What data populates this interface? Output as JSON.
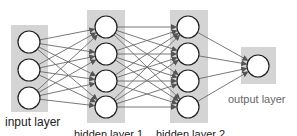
{
  "diagram": {
    "type": "feedforward-neural-network",
    "layers": [
      {
        "id": "input",
        "label": "input layer",
        "nodes": 3,
        "box": {
          "x": 11,
          "y": 25,
          "w": 37,
          "h": 87
        },
        "cx": 29,
        "cy": [
          42,
          70,
          98
        ]
      },
      {
        "id": "hidden1",
        "label": "hidden layer 1",
        "nodes": 4,
        "box": {
          "x": 87,
          "y": 10,
          "w": 38,
          "h": 113
        },
        "cx": 106,
        "cy": [
          27,
          54,
          81,
          107
        ]
      },
      {
        "id": "hidden2",
        "label": "hidden layer 2",
        "nodes": 4,
        "box": {
          "x": 170,
          "y": 10,
          "w": 38,
          "h": 113
        },
        "cx": 188,
        "cy": [
          27,
          54,
          81,
          107
        ]
      },
      {
        "id": "output",
        "label": "output layer",
        "nodes": 1,
        "box": {
          "x": 241,
          "y": 47,
          "w": 35,
          "h": 37
        },
        "cx": 258,
        "cy": [
          66
        ]
      }
    ],
    "node_radius": 11,
    "colors": {
      "layer_box": "#d4d4d4",
      "node_fill": "#ffffff",
      "node_stroke": "#222222",
      "edge": "#6a6a6a"
    },
    "connectivity": "fully-connected"
  },
  "labels": {
    "input": "input layer",
    "hidden1": "hidden layer 1",
    "hidden2": "hidden layer 2",
    "output": "output layer"
  }
}
